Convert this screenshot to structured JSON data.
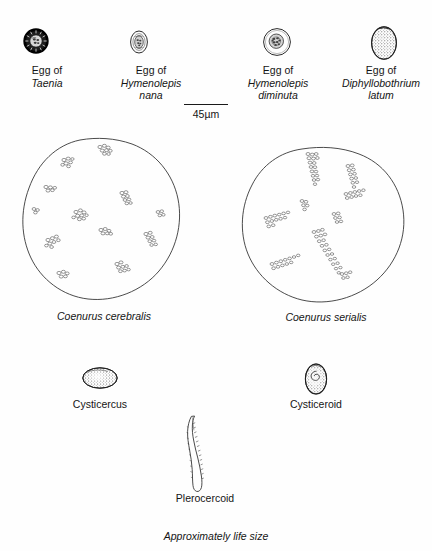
{
  "figure": {
    "note": "Approximately life size",
    "background_color": "#fefefe",
    "ink_color": "#2a2a2a"
  },
  "scale": {
    "value": "45",
    "unit": "µm",
    "label": "45µm",
    "bar_length_px": 44
  },
  "eggs": [
    {
      "id": "taenia",
      "prefix": "Egg of",
      "species": "Taenia",
      "shape": "circle",
      "appearance": "thick dark radially striated shell with embryo",
      "width_px": 22,
      "height_px": 22
    },
    {
      "id": "hymenolepis-nana",
      "prefix": "Egg of",
      "species": "Hymenolepis nana",
      "species_line1": "Hymenolepis",
      "species_line2": "nana",
      "shape": "oval",
      "appearance": "thin shell with inner oncosphere",
      "width_px": 17,
      "height_px": 22
    },
    {
      "id": "hymenolepis-diminuta",
      "prefix": "Egg of",
      "species": "Hymenolepis diminuta",
      "species_line1": "Hymenolepis",
      "species_line2": "diminuta",
      "shape": "round",
      "appearance": "clear shell with central granular oncosphere",
      "width_px": 26,
      "height_px": 28
    },
    {
      "id": "diphyllobothrium-latum",
      "prefix": "Egg of",
      "species": "Diphyllobothrium latum",
      "species_line1": "Diphyllobothrium",
      "species_line2": "latum",
      "shape": "operculate-oval",
      "appearance": "stippled granular oval with operculum",
      "width_px": 27,
      "height_px": 35
    }
  ],
  "coenurus": [
    {
      "id": "coenurus-cerebralis",
      "label": "Coenurus cerebralis",
      "arrangement": "protoscolices in scattered isolated clusters",
      "cluster_count": 12
    },
    {
      "id": "coenurus-serialis",
      "label": "Coenurus serialis",
      "arrangement": "protoscolices in branching linear rows",
      "cluster_count": 9
    }
  ],
  "larvae": [
    {
      "id": "cysticercus",
      "label": "Cysticercus",
      "shape": "horizontal stippled ellipse"
    },
    {
      "id": "cysticeroid",
      "label": "Cysticeroid",
      "shape": "vertical stippled oval with coiled scolex"
    },
    {
      "id": "plerocercoid",
      "label": "Plerocercoid",
      "shape": "elongate wrinkled solid-bodied larva"
    }
  ]
}
